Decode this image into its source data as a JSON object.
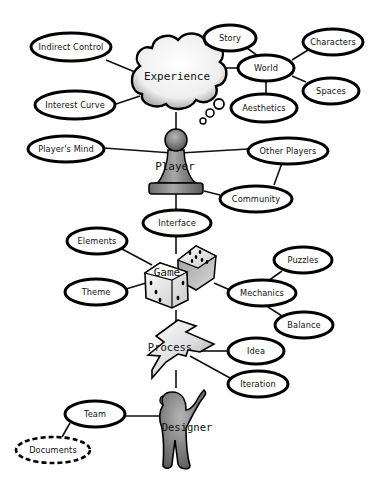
{
  "diagram": {
    "type": "concept-map",
    "major_nodes": {
      "experience": {
        "label": "Experience",
        "shape": "thought-cloud"
      },
      "player": {
        "label": "Player",
        "shape": "pawn"
      },
      "game": {
        "label": "Game",
        "shape": "dice"
      },
      "process": {
        "label": "Process",
        "shape": "lightning-bolt"
      },
      "designer": {
        "label": "Designer",
        "shape": "person"
      }
    },
    "nodes": {
      "indirect_control": {
        "label": "Indirect Control"
      },
      "interest_curve": {
        "label": "Interest Curve"
      },
      "story": {
        "label": "Story"
      },
      "world": {
        "label": "World"
      },
      "characters": {
        "label": "Characters"
      },
      "spaces": {
        "label": "Spaces"
      },
      "aesthetics": {
        "label": "Aesthetics"
      },
      "players_mind": {
        "label": "Player's Mind"
      },
      "other_players": {
        "label": "Other Players"
      },
      "community": {
        "label": "Community"
      },
      "interface": {
        "label": "Interface"
      },
      "elements": {
        "label": "Elements"
      },
      "theme": {
        "label": "Theme"
      },
      "mechanics": {
        "label": "Mechanics"
      },
      "puzzles": {
        "label": "Puzzles"
      },
      "balance": {
        "label": "Balance"
      },
      "idea": {
        "label": "Idea"
      },
      "iteration": {
        "label": "Iteration"
      },
      "team": {
        "label": "Team"
      },
      "documents": {
        "label": "Documents",
        "style": "dashed"
      }
    },
    "edges": [
      [
        "experience",
        "indirect_control"
      ],
      [
        "experience",
        "interest_curve"
      ],
      [
        "experience",
        "world"
      ],
      [
        "world",
        "story"
      ],
      [
        "world",
        "characters"
      ],
      [
        "world",
        "spaces"
      ],
      [
        "world",
        "aesthetics"
      ],
      [
        "experience",
        "player"
      ],
      [
        "player",
        "players_mind"
      ],
      [
        "player",
        "other_players"
      ],
      [
        "player",
        "community"
      ],
      [
        "other_players",
        "community"
      ],
      [
        "player",
        "interface"
      ],
      [
        "interface",
        "game"
      ],
      [
        "game",
        "elements"
      ],
      [
        "game",
        "theme"
      ],
      [
        "game",
        "mechanics"
      ],
      [
        "mechanics",
        "puzzles"
      ],
      [
        "mechanics",
        "balance"
      ],
      [
        "game",
        "process"
      ],
      [
        "process",
        "idea"
      ],
      [
        "process",
        "iteration"
      ],
      [
        "process",
        "designer"
      ],
      [
        "designer",
        "team"
      ],
      [
        "team",
        "documents"
      ]
    ]
  }
}
